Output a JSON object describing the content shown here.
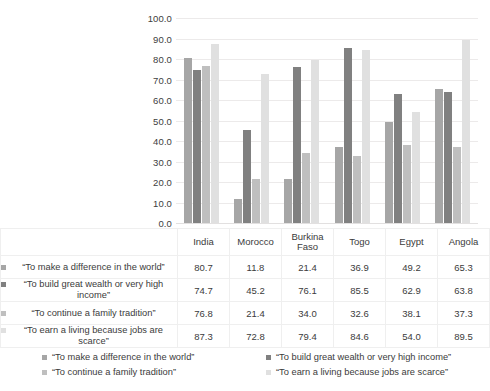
{
  "chart_data": {
    "type": "bar",
    "title": "",
    "xlabel": "",
    "ylabel": "",
    "ylim": [
      0,
      100
    ],
    "ytick_labels": [
      "100.0",
      "90.0",
      "80.0",
      "70.0",
      "60.0",
      "50.0",
      "40.0",
      "30.0",
      "20.0",
      "10.0",
      "0.0"
    ],
    "ytick_values": [
      100,
      90,
      80,
      70,
      60,
      50,
      40,
      30,
      20,
      10,
      0
    ],
    "grid": true,
    "legend_position": "bottom",
    "categories": [
      "India",
      "Morocco",
      "Burkina Faso",
      "Togo",
      "Egypt",
      "Angola"
    ],
    "series": [
      {
        "name": "“To make a difference in the world”",
        "color": "#a6a6a6",
        "values": [
          80.7,
          11.8,
          21.4,
          36.9,
          49.2,
          65.3
        ],
        "value_labels": [
          "80.7",
          "11.8",
          "21.4",
          "36.9",
          "49.2",
          "65.3"
        ]
      },
      {
        "name": "“To build great wealth or very high income”",
        "table_name": "“To build great wealth or very high income”",
        "color": "#808080",
        "values": [
          74.7,
          45.2,
          76.1,
          85.5,
          62.9,
          63.8
        ],
        "value_labels": [
          "74.7",
          "45.2",
          "76.1",
          "85.5",
          "62.9",
          "63.8"
        ]
      },
      {
        "name": "“To continue a family tradition”",
        "color": "#bfbfbf",
        "values": [
          76.8,
          21.4,
          34.0,
          32.6,
          38.1,
          37.3
        ],
        "value_labels": [
          "76.8",
          "21.4",
          "34.0",
          "32.6",
          "38.1",
          "37.3"
        ]
      },
      {
        "name": "“To earn a living because jobs are scarce”",
        "color": "#e0e0e0",
        "values": [
          87.3,
          72.8,
          79.4,
          84.6,
          54.0,
          89.5
        ],
        "value_labels": [
          "87.3",
          "72.8",
          "79.4",
          "84.6",
          "54.0",
          "89.5"
        ]
      }
    ]
  },
  "table": {
    "column_headers": [
      "India",
      "Morocco",
      "Burkina Faso",
      "Togo",
      "Egypt",
      "Angola"
    ],
    "row_labels": [
      "“To make a difference in the world”",
      "“To build great wealth or very high income”",
      "“To continue a family  tradition”",
      "“To earn a living because jobs  are scarce”"
    ]
  },
  "legend": {
    "items": [
      "“To make a difference in the world”",
      "“To build great wealth or very high income”",
      "“To continue a family tradition”",
      "“To earn a living because jobs are scarce”"
    ]
  }
}
